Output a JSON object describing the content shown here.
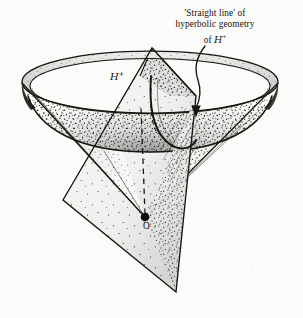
{
  "figure": {
    "domain_kind": "diagram",
    "background_color": "#fbfbfa",
    "ink_color": "#17150f",
    "width": 303,
    "height": 318
  },
  "caption": {
    "line1": "'Straight line' of",
    "line2": "hyperbolic geometry",
    "line3_prefix": "of ",
    "line3_symbol": "H",
    "line3_superscript": "+"
  },
  "labels": {
    "surface_symbol": "H",
    "surface_superscript": "+",
    "apex": "O"
  },
  "geometry": {
    "apex_point": [
      145,
      217
    ],
    "rim_ellipse": {
      "cx": 150,
      "cy": 82,
      "rx": 128,
      "ry": 31
    },
    "inner_rim_ellipse": {
      "cx": 150,
      "cy": 86,
      "rx": 120,
      "ry": 28
    },
    "bowl_bottom_y": 152,
    "plane_corners": [
      [
        152,
        48
      ],
      [
        196,
        96
      ],
      [
        176,
        292
      ],
      [
        63,
        200
      ]
    ],
    "hyperbola_label_target": [
      196,
      112
    ]
  },
  "style_notes": {
    "stipple_dot_color": "#16140f",
    "line_weight_outline": 1.15,
    "line_weight_thin": 0.55,
    "dashed_axis": "vertical dashed line from apex up through bowl"
  }
}
